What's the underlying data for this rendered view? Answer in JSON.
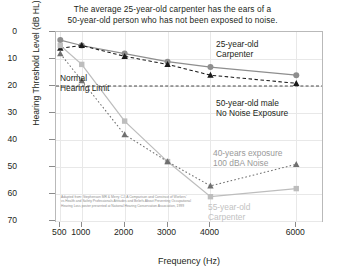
{
  "title": {
    "line1": "The average 25-year-old carpenter has the ears of a",
    "line2": "50-year-old person who has not been exposed to noise."
  },
  "annotations": {
    "carpenter25_line1": "25-year-old",
    "carpenter25_line2": "Carpenter",
    "male50_line1": "50-year-old male",
    "male50_line2": "No Noise Exposure",
    "exposure_line1": "40-years exposure",
    "exposure_line2": "100 dBA Noise",
    "carpenter55_line1": "55-year-old",
    "carpenter55_line2": "Carpenter",
    "normal_limit_line1": "Normal",
    "normal_limit_line2": "Hearing Limit"
  },
  "credit": {
    "line1": "Adapted from: Stephenson MR & Merry CJ. A Comparison and Constrast of Workers'",
    "line2": "vs Health and Safety Professionals Attitudes and Beliefs About Preventing Occupational",
    "line3": "Hearing Loss poster presented at National Hearing Conservation Association, 1999"
  },
  "colors": {
    "axis": "#b9b9b9",
    "grid": "#e8e8e8",
    "text": "#231f20",
    "series_carpenter25": "#8e8e8e",
    "series_male50": "#1a1a1a",
    "series_carpenter55": "#bdbdbd",
    "series_exposure40": "#6f6f6f",
    "normal_limit": "#333333"
  },
  "chart_data": {
    "type": "line",
    "title": "The average 25-year-old carpenter has the ears of a 50-year-old person who has not been exposed to noise.",
    "xlabel": "Frequency (Hz)",
    "ylabel": "Hearing Threshold Level (dB HL)",
    "x": [
      500,
      1000,
      2000,
      3000,
      4000,
      6000
    ],
    "xtick_labels": [
      "500",
      "1000",
      "2000",
      "3000",
      "4000",
      "6000"
    ],
    "ytick_labels": [
      "0",
      "10",
      "20",
      "30",
      "40",
      "50",
      "60",
      "70"
    ],
    "ylim": [
      0,
      70
    ],
    "y_inverted": true,
    "grid": true,
    "legend": "inline-annotations",
    "reference_line": {
      "label": "Normal Hearing Limit",
      "value": 20,
      "style": "dashed"
    },
    "series": [
      {
        "name": "25-year-old Carpenter",
        "marker": "circle",
        "line": "solid",
        "color": "#8e8e8e",
        "values": [
          3,
          5,
          8,
          11,
          13,
          16
        ]
      },
      {
        "name": "50-year-old male No Noise Exposure",
        "marker": "triangle",
        "line": "dashed",
        "color": "#1a1a1a",
        "values": [
          6,
          5,
          9,
          12,
          16,
          19
        ]
      },
      {
        "name": "55-year-old Carpenter",
        "marker": "square",
        "line": "solid",
        "color": "#bdbdbd",
        "values": [
          5,
          12,
          33,
          48,
          61,
          58
        ]
      },
      {
        "name": "40-years exposure 100 dBA Noise",
        "marker": "triangle",
        "line": "dotted",
        "color": "#6f6f6f",
        "values": [
          8,
          18,
          38,
          48,
          57,
          49
        ]
      }
    ]
  }
}
